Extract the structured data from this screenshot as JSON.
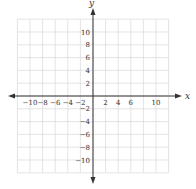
{
  "diagram": {
    "type": "cartesian-coordinate-grid",
    "axes": {
      "x_label": "x",
      "y_label": "y"
    },
    "grid": {
      "range_min": -12,
      "range_max": 12,
      "step": 2,
      "line_color": "#d9d9d9",
      "axis_color": "#333333"
    },
    "x_ticks": [
      {
        "value": -10,
        "label": "−10"
      },
      {
        "value": -8,
        "label": "−8"
      },
      {
        "value": -6,
        "label": "−6"
      },
      {
        "value": -4,
        "label": "−4"
      },
      {
        "value": -2,
        "label": "−2"
      },
      {
        "value": 2,
        "label": "2"
      },
      {
        "value": 4,
        "label": "4"
      },
      {
        "value": 6,
        "label": "6"
      },
      {
        "value": 10,
        "label": "10"
      }
    ],
    "y_ticks": [
      {
        "value": 10,
        "label": "10"
      },
      {
        "value": 8,
        "label": "8"
      },
      {
        "value": 6,
        "label": "6"
      },
      {
        "value": 4,
        "label": "4"
      },
      {
        "value": 2,
        "label": "2"
      },
      {
        "value": -2,
        "label": "−2"
      },
      {
        "value": -4,
        "label": "−4"
      },
      {
        "value": -6,
        "label": "−6"
      },
      {
        "value": -8,
        "label": "−8"
      },
      {
        "value": -10,
        "label": "−10"
      }
    ]
  }
}
